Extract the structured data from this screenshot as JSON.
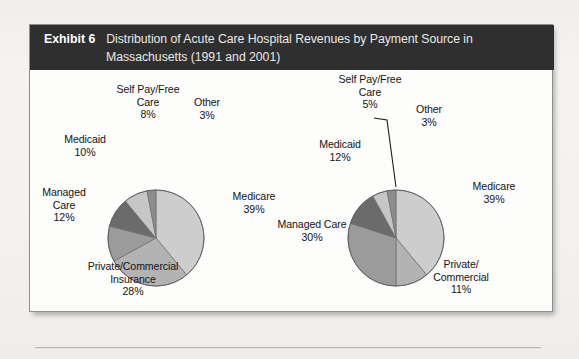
{
  "exhibit": {
    "label": "Exhibit 6",
    "title_line_1": "Distribution of Acute Care Hospital Revenues by Payment Source in",
    "title_line_2": "Massachusetts (1991 and 2001)",
    "header_bg": "#2f2f2f",
    "frame_bg": "#fdfdfc",
    "page_bg": "#f3f2f0"
  },
  "chart_data": [
    {
      "type": "pie",
      "title": "1991",
      "id": "pie-1991",
      "labels": [
        "Medicare",
        "Private/Commercial Insurance",
        "Managed Care",
        "Medicaid",
        "Self Pay/Free Care",
        "Other"
      ],
      "values": [
        39,
        28,
        12,
        10,
        8,
        3
      ],
      "value_labels": [
        "39%",
        "28%",
        "12%",
        "10%",
        "8%",
        "3%"
      ],
      "colors": [
        "#cdcdcd",
        "#b3b3b3",
        "#9b9b9b",
        "#6b6b6b",
        "#c6c6c6",
        "#8d8d8d"
      ],
      "start_angle": 0,
      "direction": "clockwise",
      "legend": "none",
      "annotations": [
        {
          "text_lines": [
            "Self Pay/Free",
            "Care",
            "8%"
          ],
          "align": "center"
        },
        {
          "text_lines": [
            "Other",
            "3%"
          ],
          "align": "center"
        },
        {
          "text_lines": [
            "Medicaid",
            "10%"
          ],
          "align": "center"
        },
        {
          "text_lines": [
            "Managed",
            "Care",
            "12%"
          ],
          "align": "center"
        },
        {
          "text_lines": [
            "Medicare",
            "39%"
          ],
          "align": "center"
        },
        {
          "text_lines": [
            "Private/Commercial",
            "Insurance",
            "28%"
          ],
          "align": "center"
        }
      ]
    },
    {
      "type": "pie",
      "title": "2001",
      "id": "pie-2001",
      "labels": [
        "Medicare",
        "Private/Commercial",
        "Managed Care",
        "Medicaid",
        "Self Pay/Free Care",
        "Other"
      ],
      "values": [
        39,
        11,
        30,
        12,
        5,
        3
      ],
      "value_labels": [
        "39%",
        "11%",
        "30%",
        "12%",
        "5%",
        "3%"
      ],
      "colors": [
        "#cdcdcd",
        "#b3b3b3",
        "#9b9b9b",
        "#6b6b6b",
        "#c6c6c6",
        "#8d8d8d"
      ],
      "start_angle": 0,
      "direction": "clockwise",
      "legend": "none",
      "has_leader_line": true,
      "annotations": [
        {
          "text_lines": [
            "Self Pay/Free",
            "Care",
            "5%"
          ],
          "align": "center"
        },
        {
          "text_lines": [
            "Other",
            "3%"
          ],
          "align": "center"
        },
        {
          "text_lines": [
            "Medicaid",
            "12%"
          ],
          "align": "center"
        },
        {
          "text_lines": [
            "Managed Care",
            "30%"
          ],
          "align": "center"
        },
        {
          "text_lines": [
            "Medicare",
            "39%"
          ],
          "align": "center"
        },
        {
          "text_lines": [
            "Private/",
            "Commercial",
            "11%"
          ],
          "align": "center"
        }
      ]
    }
  ],
  "pie_1991_labels": {
    "selfpay_l1": "Self Pay/Free",
    "selfpay_l2": "Care",
    "selfpay_pct": "8%",
    "other_l1": "Other",
    "other_pct": "3%",
    "medicaid_l1": "Medicaid",
    "medicaid_pct": "10%",
    "managed_l1": "Managed",
    "managed_l2": "Care",
    "managed_pct": "12%",
    "medicare_l1": "Medicare",
    "medicare_pct": "39%",
    "private_l1": "Private/Commercial",
    "private_l2": "Insurance",
    "private_pct": "28%"
  },
  "pie_2001_labels": {
    "selfpay_l1": "Self Pay/Free",
    "selfpay_l2": "Care",
    "selfpay_pct": "5%",
    "other_l1": "Other",
    "other_pct": "3%",
    "medicaid_l1": "Medicaid",
    "medicaid_pct": "12%",
    "managed_l1": "Managed Care",
    "managed_pct": "30%",
    "medicare_l1": "Medicare",
    "medicare_pct": "39%",
    "private_l1": "Private/",
    "private_l2": "Commercial",
    "private_pct": "11%"
  }
}
